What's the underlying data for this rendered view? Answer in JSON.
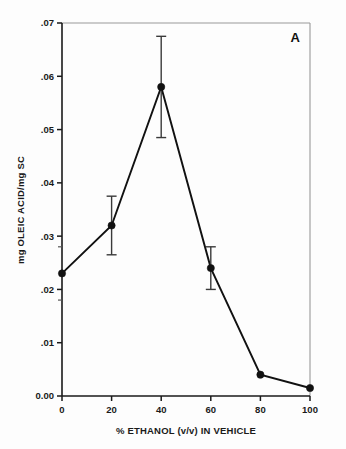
{
  "chart_data": {
    "type": "line",
    "title": "",
    "panel_label": "A",
    "xlabel": "% ETHANOL (v/v) IN VEHICLE",
    "ylabel": "mg OLEIC ACID/mg SC",
    "xlim": [
      0,
      100
    ],
    "ylim": [
      0.0,
      0.07
    ],
    "grid": false,
    "legend": null,
    "x_ticks": [
      "0",
      "20",
      "40",
      "60",
      "80",
      "100"
    ],
    "x_tick_values": [
      0,
      20,
      40,
      60,
      80,
      100
    ],
    "y_ticks": [
      "0.00",
      ".01",
      ".02",
      ".03",
      ".04",
      ".05",
      ".06",
      ".07"
    ],
    "y_tick_values": [
      0.0,
      0.01,
      0.02,
      0.03,
      0.04,
      0.05,
      0.06,
      0.07
    ],
    "y_minor_tick_values": [
      0.018,
      0.028
    ],
    "x": [
      0,
      20,
      40,
      60,
      80,
      100
    ],
    "values": [
      0.023,
      0.032,
      0.058,
      0.024,
      0.004,
      0.0015
    ],
    "errors": [
      0,
      0.0055,
      0.0095,
      0.004,
      0,
      0
    ],
    "series": [
      {
        "name": "mg OLEIC ACID/mg SC",
        "x": [
          0,
          20,
          40,
          60,
          80,
          100
        ],
        "values": [
          0.023,
          0.032,
          0.058,
          0.024,
          0.004,
          0.0015
        ],
        "errors": [
          0,
          0.0055,
          0.0095,
          0.004,
          0,
          0
        ],
        "marker": "filled-circle",
        "color": "#111111"
      }
    ]
  },
  "figure": {
    "panel_label": "A",
    "x_axis_title": "% ETHANOL (v/v) IN VEHICLE",
    "y_axis_title": "mg OLEIC ACID/mg SC"
  },
  "colors": {
    "line": "#111111",
    "marker": "#111111",
    "error_bar": "#3a3a3a",
    "axis": "#1a1a1a",
    "frame": "#999999",
    "background": "#fdfdfd"
  }
}
